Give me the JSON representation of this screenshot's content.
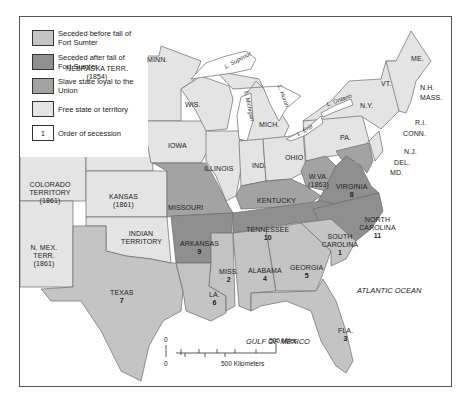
{
  "legend": {
    "items": [
      {
        "label": "Seceded before fall of Fort Sumter",
        "color": "#c4c4c4",
        "swatch_text": ""
      },
      {
        "label": "Seceded after fall of Fort Sumter",
        "color": "#8f8f8f",
        "swatch_text": ""
      },
      {
        "label": "Slave state loyal to the Union",
        "color": "#a3a3a3",
        "swatch_text": ""
      },
      {
        "label": "Free state or territory",
        "color": "#e4e4e4",
        "swatch_text": ""
      },
      {
        "label": "Order of secession",
        "color": "#ffffff",
        "swatch_text": "1"
      }
    ]
  },
  "colors": {
    "seceded_before": "#c4c4c4",
    "seceded_after": "#8f8f8f",
    "border_loyal": "#a3a3a3",
    "free": "#e4e4e4",
    "water": "#ffffff",
    "outline": "#555555"
  },
  "regions": {
    "minn": {
      "name": "MINN.",
      "status": "free"
    },
    "wis": {
      "name": "WIS.",
      "status": "free"
    },
    "mich": {
      "name": "MICH.",
      "status": "free"
    },
    "iowa": {
      "name": "IOWA",
      "status": "free"
    },
    "illinois": {
      "name": "ILLINOIS",
      "status": "free"
    },
    "ind": {
      "name": "IND.",
      "status": "free"
    },
    "ohio": {
      "name": "OHIO",
      "status": "free"
    },
    "pa": {
      "name": "PA.",
      "status": "free"
    },
    "ny": {
      "name": "N.Y.",
      "status": "free"
    },
    "vt": {
      "name": "VT.",
      "status": "free"
    },
    "me": {
      "name": "ME.",
      "status": "free"
    },
    "nh": {
      "name": "N.H.",
      "status": "free"
    },
    "mass": {
      "name": "MASS.",
      "status": "free"
    },
    "ri": {
      "name": "R.I.",
      "status": "free"
    },
    "conn": {
      "name": "CONN.",
      "status": "free"
    },
    "nj": {
      "name": "N.J.",
      "status": "free"
    },
    "del": {
      "name": "DEL.",
      "status": "loyal"
    },
    "md": {
      "name": "MD.",
      "status": "loyal"
    },
    "wva": {
      "name": "W.VA.",
      "year": "(1863)",
      "status": "loyal"
    },
    "kentucky": {
      "name": "KENTUCKY",
      "status": "loyal"
    },
    "missouri": {
      "name": "MISSOURI",
      "status": "loyal"
    },
    "nebraska": {
      "name": "NEBRASKA TERR.",
      "year": "(1854)",
      "status": "free"
    },
    "kansas": {
      "name": "KANSAS",
      "year": "(1861)",
      "status": "free"
    },
    "colorado": {
      "name": "COLORADO TERRITORY",
      "year": "(1861)",
      "status": "free"
    },
    "nmex": {
      "name": "N. MEX. TERR.",
      "year": "(1861)",
      "status": "free"
    },
    "indian": {
      "name": "INDIAN TERRITORY",
      "status": "free"
    },
    "virginia": {
      "name": "VIRGINIA",
      "order": "8",
      "status": "after"
    },
    "ncarolina": {
      "name": "NORTH CAROLINA",
      "order": "11",
      "status": "after"
    },
    "tennessee": {
      "name": "TENNESSEE",
      "order": "10",
      "status": "after"
    },
    "arkansas": {
      "name": "ARKANSAS",
      "order": "9",
      "status": "after"
    },
    "scarolina": {
      "name": "SOUTH CAROLINA",
      "order": "1",
      "status": "before"
    },
    "miss": {
      "name": "MISS.",
      "order": "2",
      "status": "before"
    },
    "fla": {
      "name": "FLA.",
      "order": "3",
      "status": "before"
    },
    "alabama": {
      "name": "ALABAMA",
      "order": "4",
      "status": "before"
    },
    "georgia": {
      "name": "GEORGIA",
      "order": "5",
      "status": "before"
    },
    "la": {
      "name": "LA.",
      "order": "6",
      "status": "before"
    },
    "texas": {
      "name": "TEXAS",
      "order": "7",
      "status": "before"
    }
  },
  "water": {
    "atlantic": "ATLANTIC OCEAN",
    "gulf": "GULF OF MEXICO",
    "superior": "L. Superior",
    "michigan": "L. Michigan",
    "huron": "L. Huron",
    "erie": "L. Erie",
    "ontario": "L. Ontario"
  },
  "scale": {
    "zero_top": "0",
    "zero_bottom": "0",
    "miles": "500 Miles",
    "km": "500 Kilometers"
  }
}
